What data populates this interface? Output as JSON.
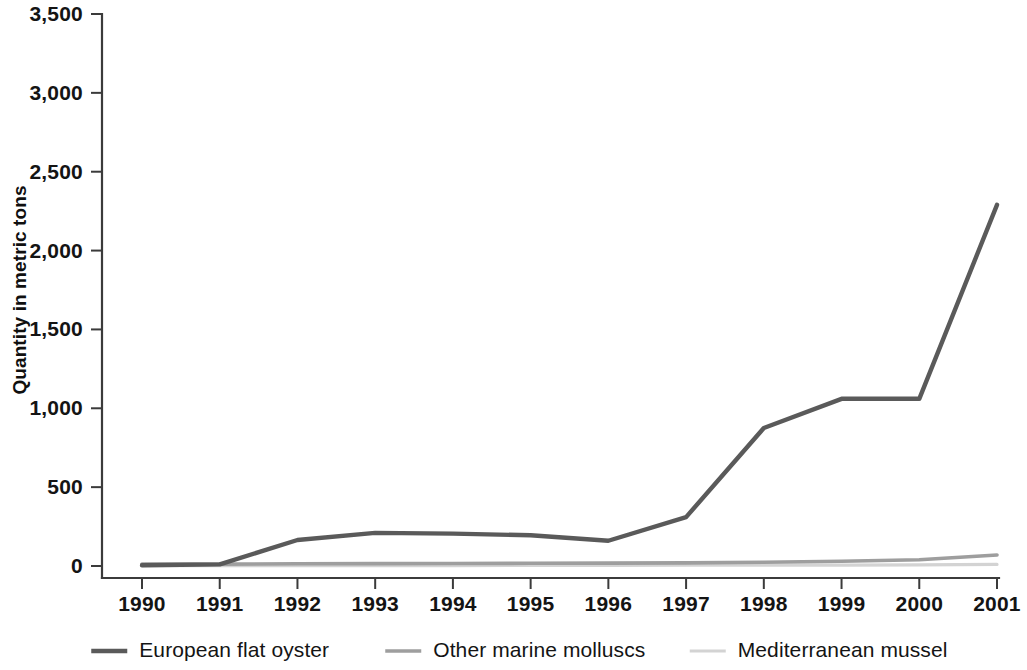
{
  "chart_data": {
    "type": "line",
    "title": "",
    "xlabel": "",
    "ylabel": "Quantity in metric tons",
    "x": [
      1990,
      1991,
      1992,
      1993,
      1994,
      1995,
      1996,
      1997,
      1998,
      1999,
      2000,
      2001
    ],
    "categories": [
      "1990",
      "1991",
      "1992",
      "1993",
      "1994",
      "1995",
      "1996",
      "1997",
      "1998",
      "1999",
      "2000",
      "2001"
    ],
    "xlim": [
      1989.6,
      2001
    ],
    "ylim": [
      0,
      3500
    ],
    "ytick_values": [
      0,
      500,
      1000,
      1500,
      2000,
      2500,
      3000,
      3500
    ],
    "ytick_labels": [
      "0",
      "500",
      "1,000",
      "1,500",
      "2,000",
      "2,500",
      "3,000",
      "3,500"
    ],
    "grid": false,
    "legend_position": "bottom",
    "series": [
      {
        "name": "European flat oyster",
        "color": "#5a5a5a",
        "width": 4.4,
        "values": [
          5,
          10,
          165,
          210,
          205,
          195,
          160,
          310,
          875,
          1060,
          1060,
          2290
        ]
      },
      {
        "name": "Other marine molluscs",
        "color": "#9e9e9e",
        "width": 3.6,
        "values": [
          12,
          12,
          14,
          15,
          16,
          17,
          18,
          20,
          24,
          30,
          40,
          70
        ]
      },
      {
        "name": "Mediterranean mussel",
        "color": "#d3d3d3",
        "width": 3.2,
        "values": [
          2,
          2,
          3,
          3,
          3,
          4,
          4,
          5,
          5,
          6,
          7,
          10
        ]
      }
    ]
  },
  "axis": {
    "y_title": "Quantity in metric tons"
  },
  "legend": {
    "items": [
      {
        "label": "European flat oyster",
        "color": "#5a5a5a"
      },
      {
        "label": "Other marine molluscs",
        "color": "#9e9e9e"
      },
      {
        "label": "Mediterranean mussel",
        "color": "#d3d3d3"
      }
    ]
  },
  "colors": {
    "european_flat_oyster": "#5a5a5a",
    "other_marine_molluscs": "#9e9e9e",
    "mediterranean_mussel": "#d3d3d3",
    "axis": "#3b3b3b",
    "text": "#141414",
    "background": "#ffffff"
  }
}
